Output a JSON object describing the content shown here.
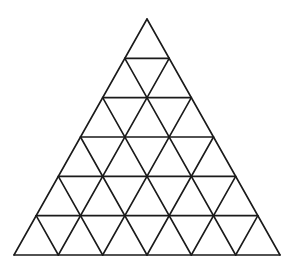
{
  "diagram": {
    "type": "triangular-grid",
    "subdivisions": 6,
    "apex": [
      147,
      19
    ],
    "base_left": [
      14,
      255
    ],
    "base_right": [
      280,
      255
    ],
    "stroke_color": "#1a1a1a",
    "background_color": "#ffffff",
    "stroke_width": 1.6,
    "small_triangle_count": 36
  }
}
